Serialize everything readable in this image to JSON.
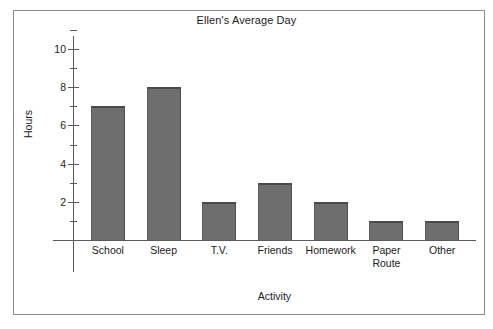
{
  "chart_data": {
    "type": "bar",
    "title": "Ellen's Average Day",
    "xlabel": "Activity",
    "ylabel": "Hours",
    "categories": [
      "School",
      "Sleep",
      "T.V.",
      "Friends",
      "Homework",
      "Paper\nRoute",
      "Other"
    ],
    "values": [
      7,
      8,
      2,
      3,
      2,
      1,
      1
    ],
    "ylim": [
      0,
      11
    ],
    "ytick_labels": [
      "2",
      "4",
      "6",
      "8",
      "10"
    ],
    "ytick_values": [
      2,
      4,
      6,
      8,
      10
    ],
    "yminor_values": [
      1,
      3,
      5,
      7,
      9,
      11
    ],
    "grid": false,
    "legend": false,
    "bar_color": "#6e6e6e",
    "bar_edge_color": "#4a4a4a",
    "axis_color": "#5a5a5a",
    "frame_color": "#8a8a8a",
    "background_color": "#ffffff"
  }
}
